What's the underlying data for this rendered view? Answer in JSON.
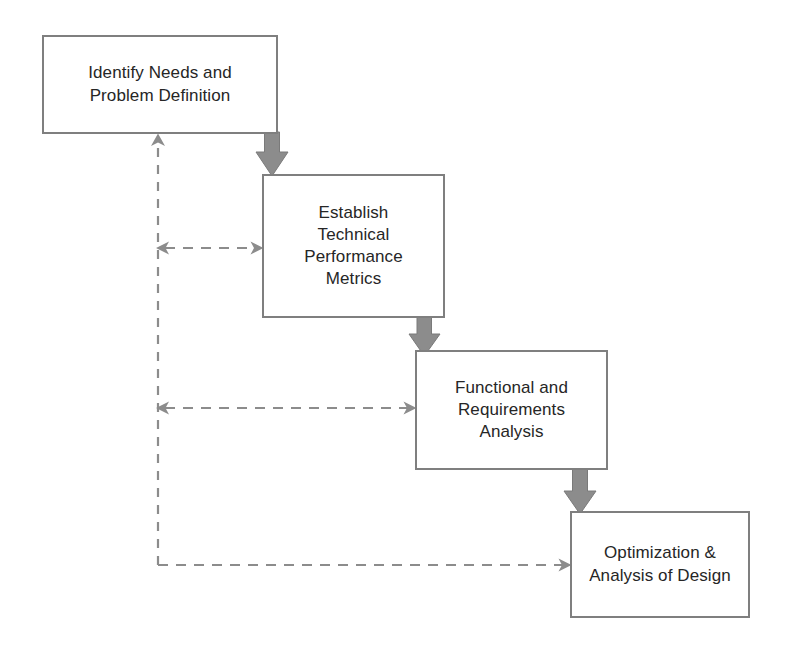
{
  "diagram": {
    "background_color": "#ffffff",
    "box_border_color": "#7f7f7f",
    "box_fill_color": "#ffffff",
    "text_color": "#262626",
    "solid_arrow_color": "#8c8c8c",
    "dashed_line_color": "#8c8c8c",
    "boxes": [
      {
        "id": "identify-needs",
        "label": "Identify Needs and\nProblem Definition",
        "order": 1,
        "x": 42,
        "y": 35,
        "width": 236,
        "height": 99
      },
      {
        "id": "technical-performance-metrics",
        "label": "Establish\nTechnical\nPerformance\nMetrics",
        "order": 2,
        "x": 262,
        "y": 174,
        "width": 183,
        "height": 144
      },
      {
        "id": "functional-requirements-analysis",
        "label": "Functional and\nRequirements\nAnalysis",
        "order": 3,
        "x": 415,
        "y": 350,
        "width": 193,
        "height": 120
      },
      {
        "id": "optimization-analysis-of-design",
        "label": "Optimization &\nAnalysis of Design",
        "order": 4,
        "x": 570,
        "y": 511,
        "width": 180,
        "height": 107
      }
    ],
    "flow_arrows": [
      {
        "id": "arrow-step1-to-step2",
        "from": "identify-needs",
        "to": "technical-performance-metrics",
        "style": "solid-block-arrow",
        "direction": "down"
      },
      {
        "id": "arrow-step2-to-step3",
        "from": "technical-performance-metrics",
        "to": "functional-requirements-analysis",
        "style": "solid-block-arrow",
        "direction": "down"
      },
      {
        "id": "arrow-step3-to-step4",
        "from": "functional-requirements-analysis",
        "to": "optimization-analysis-of-design",
        "style": "solid-block-arrow",
        "direction": "down"
      }
    ],
    "feedback_lines": [
      {
        "id": "feedback-trunk-vertical",
        "style": "dashed",
        "direction": "up",
        "target": "identify-needs",
        "arrowheads": "end"
      },
      {
        "id": "feedback-to-step2",
        "style": "dashed",
        "direction": "horizontal",
        "target": "technical-performance-metrics",
        "arrowheads": "both"
      },
      {
        "id": "feedback-to-step3",
        "style": "dashed",
        "direction": "horizontal",
        "target": "functional-requirements-analysis",
        "arrowheads": "both"
      },
      {
        "id": "feedback-to-step4",
        "style": "dashed",
        "direction": "horizontal",
        "target": "optimization-analysis-of-design",
        "arrowheads": "end"
      }
    ]
  }
}
